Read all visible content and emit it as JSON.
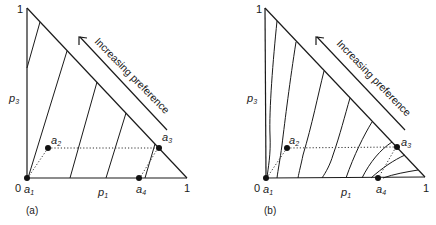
{
  "figure": {
    "panels": [
      {
        "id": "a",
        "caption": "(a)",
        "vertex_top_label": "1",
        "origin_label": "0",
        "vertex_right_label": "1",
        "x_axis_label": "p",
        "x_axis_sub": "1",
        "y_axis_label": "p",
        "y_axis_sub": "3",
        "arrow_text": "Increasing preference",
        "indifference_curves": "straight parallel lines",
        "points": [
          {
            "name": "a",
            "sub": "1"
          },
          {
            "name": "a",
            "sub": "2"
          },
          {
            "name": "a",
            "sub": "3"
          },
          {
            "name": "a",
            "sub": "4"
          }
        ]
      },
      {
        "id": "b",
        "caption": "(b)",
        "vertex_top_label": "1",
        "origin_label": "0",
        "vertex_right_label": "1",
        "x_axis_label": "p",
        "x_axis_sub": "1",
        "y_axis_label": "p",
        "y_axis_sub": "3",
        "arrow_text": "Increasing preference",
        "indifference_curves": "fanning-out curved lines",
        "points": [
          {
            "name": "a",
            "sub": "1"
          },
          {
            "name": "a",
            "sub": "2"
          },
          {
            "name": "a",
            "sub": "3"
          },
          {
            "name": "a",
            "sub": "4"
          }
        ]
      }
    ],
    "colors": {
      "ink": "#1a1a1a",
      "background": "#ffffff"
    }
  }
}
